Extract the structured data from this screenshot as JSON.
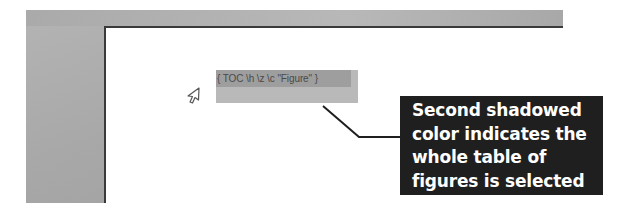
{
  "document": {
    "field_code": "{ TOC \\h \\z \\c \"Figure\" }",
    "selection_state": "selected"
  },
  "callout": {
    "lines": [
      "Second shadowed",
      "color indicates the",
      "whole table of",
      "figures is selected"
    ]
  },
  "colors": {
    "app_background": "#a8a8a8",
    "field_shading_line": "#9e9e9e",
    "field_selection": "#b9b9b9",
    "callout_background": "#1f1f1f",
    "callout_text": "#ffffff",
    "leader_line": "#1f1f1f"
  },
  "icons": {
    "cursor": "mouse-pointer-arrow-icon"
  }
}
